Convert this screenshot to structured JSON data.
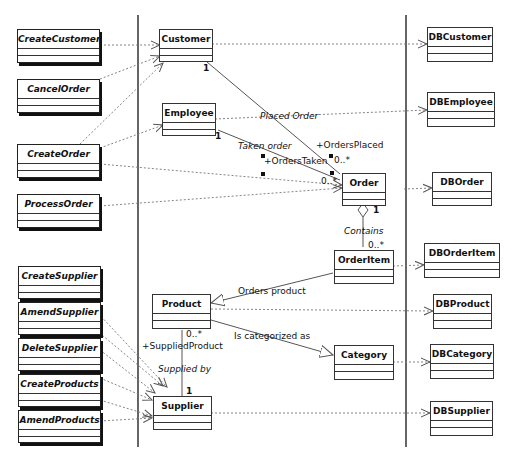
{
  "diagram": {
    "type": "UML class diagram (boundary / entity / persistence layers)",
    "colors": {
      "line": "#555555",
      "box_border": "#333333",
      "text": "#111111",
      "background": "#ffffff"
    }
  },
  "boundary_classes": [
    {
      "id": "CreateCustomer",
      "label": "CreateCustomer"
    },
    {
      "id": "CancelOrder",
      "label": "CancelOrder"
    },
    {
      "id": "CreateOrder",
      "label": "CreateOrder"
    },
    {
      "id": "ProcessOrder",
      "label": "ProcessOrder"
    },
    {
      "id": "CreateSupplier",
      "label": "CreateSupplier"
    },
    {
      "id": "AmendSupplier",
      "label": "AmendSupplier"
    },
    {
      "id": "DeleteSupplier",
      "label": "DeleteSupplier"
    },
    {
      "id": "CreateProducts",
      "label": "CreateProducts"
    },
    {
      "id": "AmendProducts",
      "label": "AmendProducts"
    }
  ],
  "entity_classes": [
    {
      "id": "Customer",
      "label": "Customer"
    },
    {
      "id": "Employee",
      "label": "Employee"
    },
    {
      "id": "Order",
      "label": "Order"
    },
    {
      "id": "OrderItem",
      "label": "OrderItem"
    },
    {
      "id": "Product",
      "label": "Product"
    },
    {
      "id": "Category",
      "label": "Category"
    },
    {
      "id": "Supplier",
      "label": "Supplier"
    }
  ],
  "db_classes": [
    {
      "id": "DBCustomer",
      "label": "DBCustomer"
    },
    {
      "id": "DBEmployee",
      "label": "DBEmployee"
    },
    {
      "id": "DBOrder",
      "label": "DBOrder"
    },
    {
      "id": "DBOrderItem",
      "label": "DBOrderItem"
    },
    {
      "id": "DBProduct",
      "label": "DBProduct"
    },
    {
      "id": "DBCategory",
      "label": "DBCategory"
    },
    {
      "id": "DBSupplier",
      "label": "DBSupplier"
    }
  ],
  "associations": {
    "placed_order": {
      "name": "Placed Order",
      "role": "+OrdersPlaced",
      "mult_customer": "1",
      "mult_order": "0..*"
    },
    "taken_order": {
      "name": "Taken order",
      "role": "+OrdersTaken",
      "mult_employee": "1",
      "mult_order": "0..*"
    },
    "contains": {
      "name": "Contains",
      "mult_order": "1",
      "mult_item": "0..*"
    },
    "orders_product": {
      "name": "Orders product"
    },
    "is_categorized_as": {
      "name": "Is categorized as"
    },
    "supplied_by": {
      "name": "Supplied by",
      "role": "+SuppliedProduct",
      "mult_product": "0..*",
      "mult_supplier": "1"
    }
  }
}
